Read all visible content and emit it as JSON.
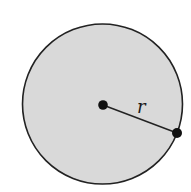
{
  "diagram": {
    "type": "circle-with-radius",
    "circle": {
      "cx": 102.5,
      "cy": 104,
      "r": 80,
      "fill": "#d9d9d9",
      "stroke": "#222222"
    },
    "center_point": {
      "x": 103,
      "y": 105
    },
    "edge_point": {
      "x": 177,
      "y": 133
    },
    "radius_label": "r",
    "label_position": {
      "x": 138,
      "y": 113
    }
  }
}
